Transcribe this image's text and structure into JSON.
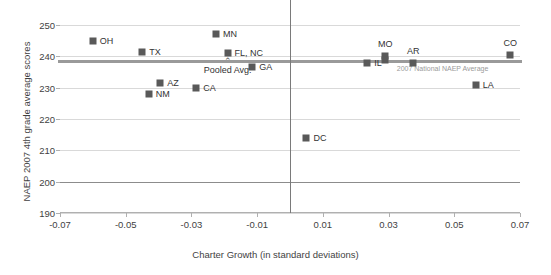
{
  "chart_data": {
    "type": "scatter",
    "title": "",
    "xlabel": "Charter Growth (in standard deviations)",
    "ylabel": "NAEP 2007 4th grade average scores",
    "xlim": [
      -0.07,
      0.07
    ],
    "ylim": [
      190,
      250
    ],
    "xticks": [
      "-0.07",
      "-0.05",
      "-0.03",
      "-0.01",
      "0.01",
      "0.03",
      "0.05",
      "0.07"
    ],
    "xtick_values": [
      -0.07,
      -0.05,
      -0.03,
      -0.01,
      0.01,
      0.03,
      0.05,
      0.07
    ],
    "yticks": [
      "250",
      "240",
      "230",
      "220",
      "210",
      "200",
      "190"
    ],
    "ytick_values": [
      250,
      240,
      230,
      220,
      210,
      200,
      190
    ],
    "grid": true,
    "legend": "none",
    "points": [
      {
        "label": "OH",
        "x": -0.06,
        "y": 245.0,
        "label_pos": "right"
      },
      {
        "label": "TX",
        "x": -0.045,
        "y": 241.5,
        "label_pos": "right"
      },
      {
        "label": "NM",
        "x": -0.043,
        "y": 228.0,
        "label_pos": "right"
      },
      {
        "label": "AZ",
        "x": -0.0395,
        "y": 231.5,
        "label_pos": "right"
      },
      {
        "label": "CA",
        "x": -0.0285,
        "y": 230.0,
        "label_pos": "right"
      },
      {
        "label": "MN",
        "x": -0.0225,
        "y": 247.0,
        "label_pos": "right"
      },
      {
        "label": "FL, NC",
        "x": -0.019,
        "y": 241.0,
        "label_pos": "right"
      },
      {
        "label": "GA",
        "x": -0.0115,
        "y": 236.5,
        "label_pos": "right"
      },
      {
        "label": "DC",
        "x": 0.005,
        "y": 214.0,
        "label_pos": "right"
      },
      {
        "label": "IL",
        "x": 0.0235,
        "y": 238.0,
        "label_pos": "right"
      },
      {
        "label": "MO",
        "x": 0.029,
        "y": 240.2,
        "label_pos": "above"
      },
      {
        "label": "",
        "x": 0.029,
        "y": 238.7,
        "label_pos": "none"
      },
      {
        "label": "AR",
        "x": 0.0375,
        "y": 238.0,
        "label_pos": "above"
      },
      {
        "label": "LA",
        "x": 0.0565,
        "y": 231.0,
        "label_pos": "right"
      },
      {
        "label": "CO",
        "x": 0.067,
        "y": 240.5,
        "label_pos": "above"
      }
    ],
    "reference_lines": [
      {
        "name": "national_average",
        "orientation": "horizontal",
        "value": 238.6,
        "label": "2007 National NAEP Average",
        "color": "#9a9a9a"
      },
      {
        "name": "zero_growth",
        "orientation": "vertical",
        "value": 0.0,
        "label": "",
        "color": "#7a7a7a"
      }
    ],
    "annotations": [
      {
        "name": "pooled-average",
        "text": "Pooled Avg.",
        "x": -0.019,
        "y": 236.2,
        "arrow": "up"
      }
    ],
    "colors": {
      "marker": "#595959",
      "gridline": "#d9d9d9",
      "axis": "#b0b0b0",
      "average_line": "#9a9a9a",
      "vertical_line": "#7a7a7a",
      "text": "#333333"
    }
  }
}
